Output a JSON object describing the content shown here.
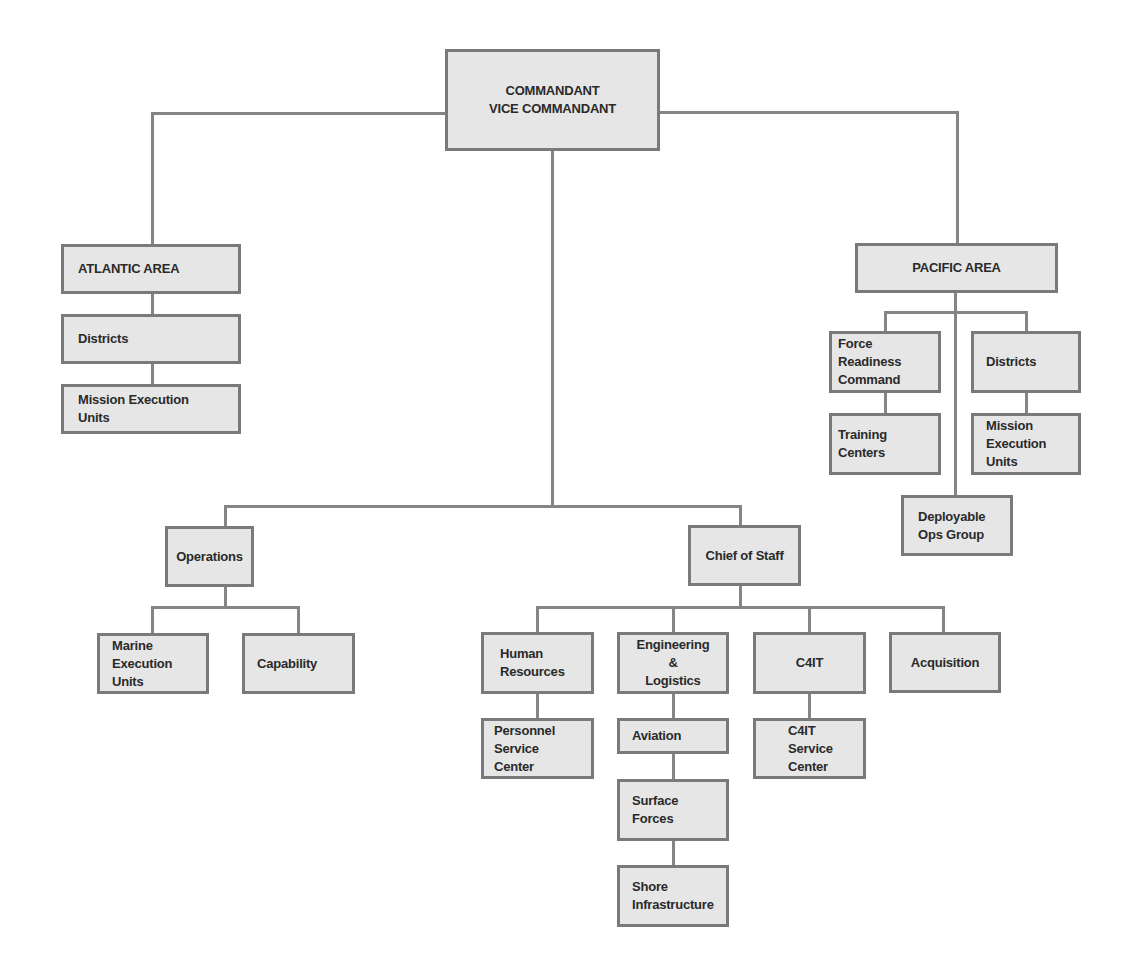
{
  "diagram": {
    "type": "org-chart",
    "top": {
      "line1": "COMMANDANT",
      "line2": "VICE COMMANDANT"
    },
    "atlantic": {
      "title": "ATLANTIC AREA",
      "children": [
        "Districts",
        "Mission Execution\nUnits"
      ]
    },
    "pacific": {
      "title": "PACIFIC AREA",
      "force_readiness": "Force\nReadiness\nCommand",
      "training_centers": "Training\nCenters",
      "districts": "Districts",
      "mission_execution": "Mission\nExecution\nUnits",
      "deployable_ops": "Deployable\nOps Group"
    },
    "operations": {
      "title": "Operations",
      "children": [
        "Marine\nExecution\nUnits",
        "Capability"
      ]
    },
    "chief_of_staff": {
      "title": "Chief of Staff",
      "human_resources": "Human\nResources",
      "personnel_service": "Personnel\nService\nCenter",
      "engineering": "Engineering\n&\nLogistics",
      "aviation": "Aviation",
      "surface_forces": "Surface\nForces",
      "shore_infrastructure": "Shore\nInfrastructure",
      "c4it": "C4IT",
      "c4it_service": "C4IT\nService\nCenter",
      "acquisition": "Acquisition"
    },
    "colors": {
      "box_fill": "#e6e6e6",
      "box_border": "#7a7a7a",
      "line": "#858585",
      "text": "#2a2a2a"
    }
  }
}
